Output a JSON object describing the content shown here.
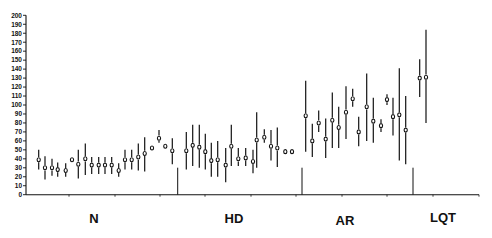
{
  "chart_data": {
    "type": "scatter",
    "subtype": "point-range (mean with vertical range bars)",
    "title": "",
    "xlabel": "",
    "ylabel": "",
    "ylim": [
      0,
      200
    ],
    "yticks": [
      0,
      10,
      20,
      30,
      40,
      50,
      60,
      70,
      80,
      90,
      100,
      110,
      120,
      130,
      140,
      150,
      160,
      170,
      180,
      190,
      200
    ],
    "grid": false,
    "legend": null,
    "groups": [
      {
        "label": "N",
        "label_x": 94
      },
      {
        "label": "HD",
        "label_x": 234
      },
      {
        "label": "AR",
        "label_x": 345
      },
      {
        "label": "LQT",
        "label_x": 443
      }
    ],
    "group_separators_x": [
      177.7,
      302,
      413
    ],
    "separator_height": 27,
    "points": [
      {
        "group": "N",
        "x": 38.7,
        "y": 39,
        "low": 28,
        "high": 50
      },
      {
        "group": "N",
        "x": 45.0,
        "y": 30,
        "low": 17,
        "high": 43
      },
      {
        "group": "N",
        "x": 52.0,
        "y": 30,
        "low": 21,
        "high": 40
      },
      {
        "group": "N",
        "x": 57.7,
        "y": 28,
        "low": 20,
        "high": 36
      },
      {
        "group": "N",
        "x": 65.7,
        "y": 27,
        "low": 20,
        "high": 35
      },
      {
        "group": "N",
        "x": 72.0,
        "y": 39,
        "low": null,
        "high": null
      },
      {
        "group": "N",
        "x": 78.3,
        "y": 34,
        "low": 18,
        "high": 50
      },
      {
        "group": "N",
        "x": 85.3,
        "y": 40,
        "low": 22,
        "high": 57
      },
      {
        "group": "N",
        "x": 91.7,
        "y": 33,
        "low": 23,
        "high": 42
      },
      {
        "group": "N",
        "x": 98.7,
        "y": 33,
        "low": 23,
        "high": 42
      },
      {
        "group": "N",
        "x": 105.0,
        "y": 33,
        "low": 23,
        "high": 42
      },
      {
        "group": "N",
        "x": 111.7,
        "y": 33,
        "low": 23,
        "high": 42
      },
      {
        "group": "N",
        "x": 118.7,
        "y": 27,
        "low": 20,
        "high": 35
      },
      {
        "group": "N",
        "x": 125.0,
        "y": 39,
        "low": 28,
        "high": 50
      },
      {
        "group": "N",
        "x": 131.7,
        "y": 39,
        "low": 28,
        "high": 50
      },
      {
        "group": "N",
        "x": 138.3,
        "y": 42,
        "low": 27,
        "high": 57
      },
      {
        "group": "N",
        "x": 144.7,
        "y": 46,
        "low": 26,
        "high": 64
      },
      {
        "group": "N",
        "x": 152.0,
        "y": 52,
        "low": null,
        "high": null
      },
      {
        "group": "N",
        "x": 159.0,
        "y": 63,
        "low": 58,
        "high": 72
      },
      {
        "group": "N",
        "x": 165.3,
        "y": 54,
        "low": null,
        "high": null
      },
      {
        "group": "N",
        "x": 172.3,
        "y": 49,
        "low": 34,
        "high": 63
      },
      {
        "group": "HD",
        "x": 186.3,
        "y": 49,
        "low": 28,
        "high": 70
      },
      {
        "group": "HD",
        "x": 192.7,
        "y": 55,
        "low": 32,
        "high": 78
      },
      {
        "group": "HD",
        "x": 199.3,
        "y": 53,
        "low": 30,
        "high": 78
      },
      {
        "group": "HD",
        "x": 205.3,
        "y": 48,
        "low": 28,
        "high": 68
      },
      {
        "group": "HD",
        "x": 211.3,
        "y": 38,
        "low": 20,
        "high": 58
      },
      {
        "group": "HD",
        "x": 217.7,
        "y": 39,
        "low": 20,
        "high": 60
      },
      {
        "group": "HD",
        "x": 225.7,
        "y": 33,
        "low": 14,
        "high": 52
      },
      {
        "group": "HD",
        "x": 231.3,
        "y": 54,
        "low": 32,
        "high": 78
      },
      {
        "group": "HD",
        "x": 238.3,
        "y": 40,
        "low": 32,
        "high": 52
      },
      {
        "group": "HD",
        "x": 245.7,
        "y": 41,
        "low": 32,
        "high": 52
      },
      {
        "group": "HD",
        "x": 253.0,
        "y": 37,
        "low": 24,
        "high": 50
      },
      {
        "group": "HD",
        "x": 256.7,
        "y": 61,
        "low": 30,
        "high": 92
      },
      {
        "group": "HD",
        "x": 264.3,
        "y": 64,
        "low": 58,
        "high": 73
      },
      {
        "group": "HD",
        "x": 271.0,
        "y": 54,
        "low": 38,
        "high": 72
      },
      {
        "group": "HD",
        "x": 277.3,
        "y": 52,
        "low": 31,
        "high": 75
      },
      {
        "group": "HD",
        "x": 285.3,
        "y": 48,
        "low": null,
        "high": null
      },
      {
        "group": "HD",
        "x": 292.0,
        "y": 48,
        "low": null,
        "high": null
      },
      {
        "group": "AR",
        "x": 305.7,
        "y": 88,
        "low": 48,
        "high": 127
      },
      {
        "group": "AR",
        "x": 312.3,
        "y": 60,
        "low": 42,
        "high": 79
      },
      {
        "group": "AR",
        "x": 318.7,
        "y": 80,
        "low": 70,
        "high": 94
      },
      {
        "group": "AR",
        "x": 325.7,
        "y": 62,
        "low": 41,
        "high": 85
      },
      {
        "group": "AR",
        "x": 332.3,
        "y": 83,
        "low": 52,
        "high": 114
      },
      {
        "group": "AR",
        "x": 338.7,
        "y": 75,
        "low": 52,
        "high": 98
      },
      {
        "group": "AR",
        "x": 346.0,
        "y": 92,
        "low": 62,
        "high": 121
      },
      {
        "group": "AR",
        "x": 352.7,
        "y": 107,
        "low": 98,
        "high": 118
      },
      {
        "group": "AR",
        "x": 358.7,
        "y": 70,
        "low": 54,
        "high": 87
      },
      {
        "group": "AR",
        "x": 366.7,
        "y": 98,
        "low": 60,
        "high": 135
      },
      {
        "group": "AR",
        "x": 373.3,
        "y": 82,
        "low": 58,
        "high": 108
      },
      {
        "group": "AR",
        "x": 381.0,
        "y": 77,
        "low": 70,
        "high": 84
      },
      {
        "group": "AR",
        "x": 387.0,
        "y": 106,
        "low": 100,
        "high": 112
      },
      {
        "group": "AR",
        "x": 393.0,
        "y": 87,
        "low": 66,
        "high": 108
      },
      {
        "group": "AR",
        "x": 399.3,
        "y": 89,
        "low": 38,
        "high": 141
      },
      {
        "group": "AR",
        "x": 405.7,
        "y": 72,
        "low": 34,
        "high": 110
      },
      {
        "group": "LQT",
        "x": 419.7,
        "y": 130,
        "low": 109,
        "high": 151
      },
      {
        "group": "LQT",
        "x": 426.0,
        "y": 131,
        "low": 80,
        "high": 184
      }
    ]
  },
  "axes": {
    "x_start": 26,
    "x_end": 479,
    "y_zero_px": 194.7,
    "y_top_px": 15.3,
    "x_minor_ticks": [
      69,
      115,
      160,
      205,
      251,
      296,
      342,
      387,
      433,
      479
    ]
  },
  "labels": {
    "N": "N",
    "HD": "HD",
    "AR": "AR",
    "LQT": "LQT"
  },
  "colors": {
    "ink": "#111111",
    "background": "#ffffff"
  }
}
